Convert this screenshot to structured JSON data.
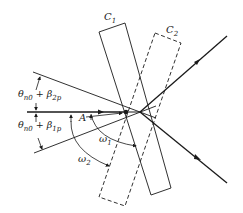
{
  "diagram": {
    "type": "optics-ray-diagram",
    "labels": {
      "crystal1": "C",
      "crystal1_sub": "1",
      "crystal2": "C",
      "crystal2_sub": "2",
      "upper_angle_main": "θ",
      "upper_angle_sub1": "n0",
      "upper_angle_plus": " + β",
      "upper_angle_sub2": "2p",
      "lower_angle_main": "θ",
      "lower_angle_sub1": "n0",
      "lower_angle_plus": " + β",
      "lower_angle_sub2": "1p",
      "point": "A",
      "omega1": "ω",
      "omega1_sub": "1",
      "omega2": "ω",
      "omega2_sub": "2"
    },
    "elements": [
      {
        "name": "crystal-C1",
        "style": "solid",
        "corners": [
          [
            99,
            32
          ],
          [
            125,
            23
          ],
          [
            171,
            188
          ],
          [
            151,
            195
          ]
        ]
      },
      {
        "name": "crystal-C2",
        "style": "dashed",
        "corners": [
          [
            155,
            33
          ],
          [
            181,
            43
          ],
          [
            125,
            206
          ],
          [
            99,
            197
          ]
        ]
      },
      {
        "name": "incident-ray",
        "from": [
          27,
          112
        ],
        "to": [
          126,
          112
        ]
      },
      {
        "name": "upper-boundary-ray",
        "from": [
          33,
          72
        ],
        "to": [
          140,
          113
        ]
      },
      {
        "name": "lower-boundary-ray",
        "from": [
          34,
          153
        ],
        "to": [
          140,
          110
        ]
      },
      {
        "name": "reflected-ray-upper",
        "from": [
          140,
          112
        ],
        "to": [
          227,
          36
        ]
      },
      {
        "name": "reflected-ray-lower",
        "from": [
          140,
          112
        ],
        "to": [
          227,
          183
        ]
      }
    ],
    "colors": {
      "line": "#1a1a1a",
      "background": "#ffffff"
    }
  }
}
